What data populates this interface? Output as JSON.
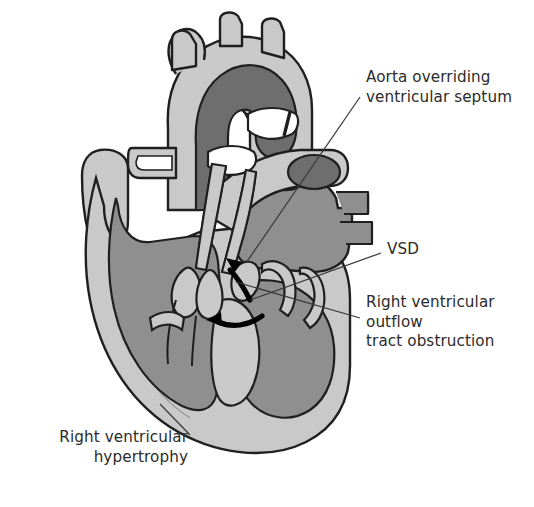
{
  "figure": {
    "name": "tetralogy-of-fallot-heart-diagram",
    "background_color": "#ffffff"
  },
  "palette": {
    "myocardium_light": "#c9c9c9",
    "chamber_mid": "#8f8f8f",
    "lumen_dark": "#6e6e6e",
    "outline": "#1f1f1f",
    "leader_line": "#3a3a3a",
    "arrow_black": "#000000",
    "text": "#2b2b2b",
    "white": "#ffffff"
  },
  "labels": {
    "aorta_overriding": "Aorta overriding\nventricular septum",
    "vsd": "VSD",
    "rv_outflow_obstruction": "Right ventricular\noutflow\ntract obstruction",
    "rv_hypertrophy": "Right ventricular\nhypertrophy"
  },
  "anatomy": {
    "parts": [
      "aortic-arch",
      "brachiocephalic-trunk",
      "left-common-carotid-artery",
      "left-subclavian-artery",
      "descending-aorta",
      "pulmonary-artery",
      "left-atrial-appendage",
      "right-atrium",
      "pulmonary-vein-stumps",
      "superior-vena-cava",
      "left-ventricle",
      "right-ventricle",
      "interventricular-septum",
      "mitral-valve-leaflets",
      "tricuspid-valve-leaflets",
      "aortic-valve-leaflets",
      "ventricular-septal-defect",
      "shunt-flow-arrow"
    ]
  }
}
